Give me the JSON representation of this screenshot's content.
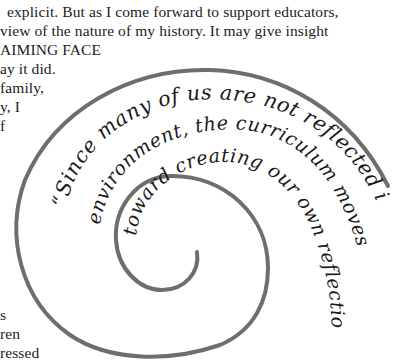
{
  "document": {
    "body_lines": [
      {
        "text": "explicit.  But as I come forward to support educators,",
        "x": 7,
        "y": 3
      },
      {
        "text": "view of the nature of my history. It may give insight",
        "x": 0,
        "y": 22
      },
      {
        "text": "AIMING  FACE",
        "x": 0,
        "y": 41
      },
      {
        "text": "ay  it  did.",
        "x": 0,
        "y": 60
      },
      {
        "text": "family,",
        "x": 0,
        "y": 79
      },
      {
        "text": "y, I",
        "x": 0,
        "y": 98
      },
      {
        "text": "f",
        "x": 0,
        "y": 117
      },
      {
        "text": "s",
        "x": 0,
        "y": 306
      },
      {
        "text": "ren",
        "x": 0,
        "y": 325
      },
      {
        "text": "ressed",
        "x": 0,
        "y": 344
      }
    ]
  },
  "figure": {
    "type": "spiral-quote",
    "stroke_color": "#6e6e6e",
    "quote": {
      "line1": "“Since many of us are not reflected in our",
      "line2": "environment, the curriculum moves us",
      "line3": "toward creating our own reflection…”"
    }
  }
}
